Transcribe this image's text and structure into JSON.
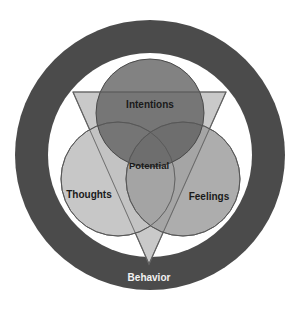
{
  "diagram": {
    "type": "venn-in-ring",
    "colors": {
      "background": "#ffffff",
      "outer_ring": "#4b4b4b",
      "inner_disc": "#ffffff",
      "triangle_fill": "#c9c9c9",
      "triangle_stroke": "#6e6e6e",
      "intentions_fill": "#6f6f6f",
      "thoughts_fill": "#c2c2c2",
      "feelings_fill": "#a3a3a3",
      "circle_stroke": "#5a5a5a",
      "label_dark": "#1a1a1a",
      "label_light": "#f2f2f2"
    },
    "outer_ring": {
      "label": "Behavior"
    },
    "circles": [
      {
        "id": "intentions",
        "label": "Intentions"
      },
      {
        "id": "thoughts",
        "label": "Thoughts"
      },
      {
        "id": "feelings",
        "label": "Feelings"
      }
    ],
    "center": {
      "label": "Potential"
    }
  }
}
